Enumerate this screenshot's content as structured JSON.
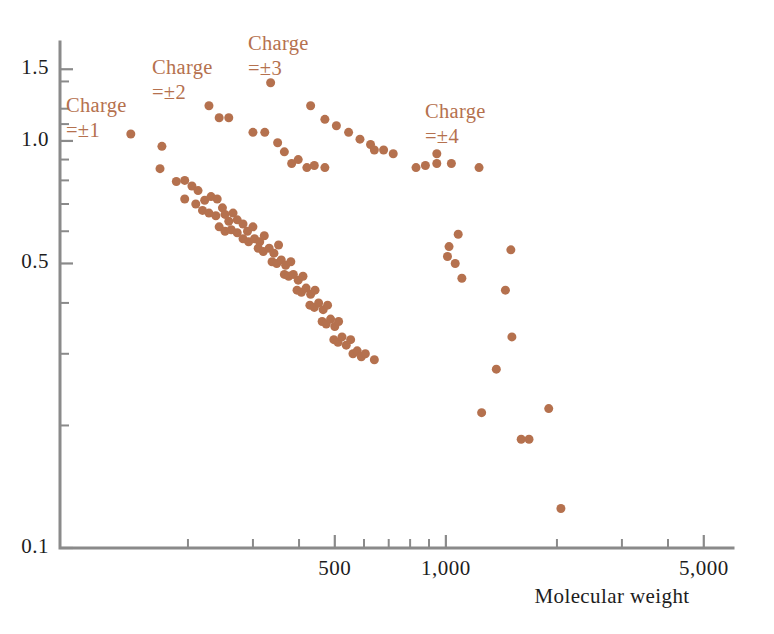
{
  "chart_data": {
    "type": "scatter",
    "title": "",
    "subtitle": "",
    "xlabel": "Molecular weight",
    "ylabel": "",
    "xscale": "log",
    "yscale": "log",
    "xlim": [
      90,
      6000
    ],
    "ylim": [
      0.1,
      1.75
    ],
    "grid": false,
    "legend_position": "inline-annotations",
    "marker": {
      "shape": "circle",
      "color": "#b5714e",
      "size_px": 9
    },
    "axis_color": "#8a8a8a",
    "text_color": "#1d1d1d",
    "x_tick_labels": [
      {
        "value": 500,
        "label": "500"
      },
      {
        "value": 1000,
        "label": "1,000"
      },
      {
        "value": 5000,
        "label": "5,000"
      }
    ],
    "x_minor_ticks": [
      200,
      300,
      400,
      500,
      600,
      700,
      800,
      900,
      1000,
      2000,
      3000,
      4000,
      5000
    ],
    "y_tick_labels": [
      {
        "value": 1.5,
        "label": "1.5"
      },
      {
        "value": 1.0,
        "label": "1.0"
      },
      {
        "value": 0.5,
        "label": "0.5"
      },
      {
        "value": 0.1,
        "label": "0.1"
      }
    ],
    "y_minor_ticks": [
      1.5,
      1.4,
      1.2,
      1.1,
      1.0,
      0.9,
      0.8,
      0.7,
      0.6,
      0.5,
      0.4,
      0.3,
      0.2,
      0.1
    ],
    "annotations": [
      {
        "name": "charge-1",
        "line1": "Charge",
        "line2": "=±1",
        "x_px": 66,
        "y_px": 112
      },
      {
        "name": "charge-2",
        "line1": "Charge",
        "line2": "=±2",
        "x_px": 152,
        "y_px": 74
      },
      {
        "name": "charge-3",
        "line1": "Charge",
        "line2": "=±3",
        "x_px": 248,
        "y_px": 50
      },
      {
        "name": "charge-4",
        "line1": "Charge",
        "line2": "=±4",
        "x_px": 425,
        "y_px": 118
      }
    ],
    "series": [
      {
        "name": "Charge = ±1",
        "points": [
          [
            140,
            1.04
          ],
          [
            170,
            0.97
          ]
        ]
      },
      {
        "name": "Charge = ±2",
        "points": [
          [
            228,
            1.22
          ],
          [
            243,
            1.14
          ],
          [
            258,
            1.14
          ],
          [
            300,
            1.05
          ],
          [
            323,
            1.05
          ],
          [
            350,
            0.99
          ],
          [
            365,
            0.94
          ],
          [
            382,
            0.88
          ],
          [
            398,
            0.9
          ],
          [
            420,
            0.86
          ],
          [
            440,
            0.87
          ],
          [
            470,
            0.86
          ]
        ]
      },
      {
        "name": "Charge = ±3",
        "points": [
          [
            335,
            1.39
          ],
          [
            430,
            1.22
          ],
          [
            470,
            1.13
          ],
          [
            505,
            1.09
          ],
          [
            545,
            1.05
          ],
          [
            585,
            1.01
          ],
          [
            625,
            0.98
          ],
          [
            640,
            0.95
          ],
          [
            678,
            0.95
          ],
          [
            720,
            0.93
          ]
        ]
      },
      {
        "name": "Charge = ±4",
        "points": [
          [
            945,
            0.93
          ],
          [
            945,
            0.88
          ],
          [
            830,
            0.86
          ],
          [
            880,
            0.87
          ],
          [
            1035,
            0.88
          ],
          [
            1230,
            0.86
          ]
        ]
      },
      {
        "name": "Main band upper",
        "points": [
          [
            168,
            0.855
          ],
          [
            186,
            0.795
          ],
          [
            196,
            0.8
          ],
          [
            205,
            0.775
          ],
          [
            213,
            0.755
          ],
          [
            196,
            0.72
          ],
          [
            210,
            0.7
          ],
          [
            222,
            0.715
          ],
          [
            231,
            0.73
          ],
          [
            240,
            0.72
          ],
          [
            219,
            0.675
          ],
          [
            228,
            0.665
          ],
          [
            238,
            0.655
          ],
          [
            248,
            0.685
          ],
          [
            252,
            0.66
          ],
          [
            258,
            0.635
          ],
          [
            265,
            0.665
          ],
          [
            272,
            0.64
          ],
          [
            243,
            0.615
          ],
          [
            252,
            0.6
          ],
          [
            262,
            0.605
          ],
          [
            272,
            0.595
          ],
          [
            282,
            0.625
          ],
          [
            290,
            0.6
          ],
          [
            300,
            0.615
          ],
          [
            282,
            0.575
          ],
          [
            292,
            0.565
          ],
          [
            303,
            0.575
          ],
          [
            313,
            0.565
          ],
          [
            322,
            0.585
          ],
          [
            310,
            0.545
          ],
          [
            320,
            0.535
          ],
          [
            332,
            0.545
          ],
          [
            342,
            0.53
          ],
          [
            352,
            0.555
          ],
          [
            338,
            0.505
          ],
          [
            348,
            0.5
          ],
          [
            358,
            0.51
          ],
          [
            368,
            0.495
          ],
          [
            380,
            0.505
          ],
          [
            365,
            0.47
          ],
          [
            375,
            0.465
          ],
          [
            386,
            0.47
          ],
          [
            398,
            0.455
          ],
          [
            410,
            0.465
          ],
          [
            395,
            0.43
          ],
          [
            406,
            0.425
          ],
          [
            418,
            0.435
          ],
          [
            430,
            0.42
          ],
          [
            442,
            0.43
          ],
          [
            428,
            0.395
          ],
          [
            440,
            0.39
          ],
          [
            452,
            0.4
          ],
          [
            465,
            0.385
          ],
          [
            478,
            0.395
          ],
          [
            462,
            0.36
          ],
          [
            474,
            0.355
          ],
          [
            487,
            0.365
          ],
          [
            500,
            0.35
          ],
          [
            512,
            0.36
          ],
          [
            497,
            0.325
          ],
          [
            510,
            0.32
          ],
          [
            523,
            0.33
          ],
          [
            537,
            0.315
          ],
          [
            552,
            0.325
          ],
          [
            560,
            0.3
          ],
          [
            575,
            0.305
          ],
          [
            590,
            0.295
          ],
          [
            605,
            0.3
          ],
          [
            640,
            0.29
          ]
        ]
      },
      {
        "name": "Sparse tail",
        "points": [
          [
            1080,
            0.59
          ],
          [
            1020,
            0.55
          ],
          [
            1010,
            0.52
          ],
          [
            1060,
            0.5
          ],
          [
            1105,
            0.46
          ],
          [
            1500,
            0.54
          ],
          [
            1450,
            0.43
          ],
          [
            1510,
            0.33
          ],
          [
            1370,
            0.275
          ],
          [
            1250,
            0.215
          ],
          [
            1600,
            0.185
          ],
          [
            1680,
            0.185
          ],
          [
            2050,
            0.125
          ],
          [
            1900,
            0.22
          ]
        ]
      }
    ]
  }
}
